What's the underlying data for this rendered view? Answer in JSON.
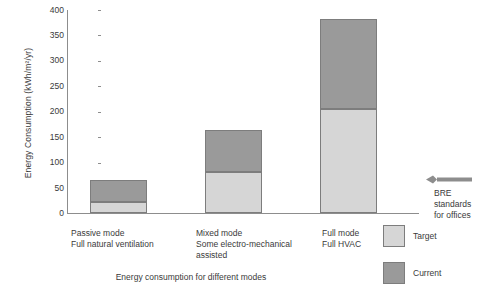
{
  "chart_data": {
    "type": "bar",
    "stacked": true,
    "title": "",
    "xlabel": "Energy consumption for different modes",
    "ylabel": "Energy Consumption (kWh/m²/yr)",
    "ylim": [
      0,
      400
    ],
    "ytick_labels": [
      "400",
      "350",
      "300",
      "250",
      "200",
      "150",
      "100",
      "50",
      "0"
    ],
    "ytick_values": [
      400,
      350,
      300,
      250,
      200,
      150,
      100,
      50,
      0
    ],
    "grid": false,
    "legend_position": "right-bottom",
    "categories": [
      {
        "line1": "Passive mode",
        "line2": "Full natural ventilation"
      },
      {
        "line1": "Mixed mode",
        "line2": "Some electro-mechanical assisted"
      },
      {
        "line1": "Full mode",
        "line2": "Full HVAC"
      }
    ],
    "series": [
      {
        "name": "Target",
        "color": "#d6d6d6",
        "values": [
          22,
          81,
          205
        ]
      },
      {
        "name": "Current",
        "color": "#9a9a9a",
        "values": [
          43,
          83,
          177
        ]
      }
    ],
    "totals": [
      65,
      164,
      382
    ],
    "annotations": [
      {
        "name": "bre-standards",
        "line1": "BRE",
        "line2": "standards",
        "line3": "for offices",
        "arrow": "left-arrow",
        "value": 70
      }
    ]
  },
  "legend": {
    "items": [
      {
        "label": "Target",
        "color": "#d6d6d6"
      },
      {
        "label": "Current",
        "color": "#9a9a9a"
      }
    ]
  }
}
